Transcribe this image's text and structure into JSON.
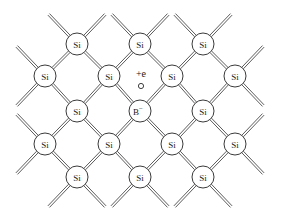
{
  "figure": {
    "background_color": "#ffffff",
    "bond_color": "#4a4a4a",
    "atom_outline_color": "#3a3a3a",
    "label_color": "#1a1a1a",
    "width": 283,
    "height": 222
  },
  "lattice": {
    "atom_radius": 11,
    "bond_gap": 2.2,
    "stub_length": 30,
    "rows": [
      {
        "row_index": 0,
        "y": 44,
        "atoms": [
          {
            "label": "Si",
            "superscript": "",
            "x": 77,
            "y": 44,
            "name": "atom-si-r0c0"
          },
          {
            "label": "Si",
            "superscript": "",
            "x": 140,
            "y": 44,
            "name": "atom-si-r0c1"
          },
          {
            "label": "Si",
            "superscript": "",
            "x": 203,
            "y": 44,
            "name": "atom-si-r0c2"
          }
        ]
      },
      {
        "row_index": 1,
        "y": 76,
        "atoms": [
          {
            "label": "Si",
            "superscript": "",
            "x": 45,
            "y": 76,
            "name": "atom-si-r1c0"
          },
          {
            "label": "Si",
            "superscript": "",
            "x": 109,
            "y": 76,
            "name": "atom-si-r1c1"
          },
          {
            "label": "Si",
            "superscript": "",
            "x": 172,
            "y": 76,
            "name": "atom-si-r1c2"
          },
          {
            "label": "Si",
            "superscript": "",
            "x": 235,
            "y": 76,
            "name": "atom-si-r1c3"
          }
        ]
      },
      {
        "row_index": 2,
        "y": 111,
        "atoms": [
          {
            "label": "Si",
            "superscript": "",
            "x": 77,
            "y": 111,
            "name": "atom-si-r2c0"
          },
          {
            "label": "B",
            "superscript": "−",
            "x": 140,
            "y": 111,
            "name": "atom-boron-dopant"
          },
          {
            "label": "Si",
            "superscript": "",
            "x": 203,
            "y": 111,
            "name": "atom-si-r2c2"
          }
        ]
      },
      {
        "row_index": 3,
        "y": 144,
        "atoms": [
          {
            "label": "Si",
            "superscript": "",
            "x": 45,
            "y": 144,
            "name": "atom-si-r3c0"
          },
          {
            "label": "Si",
            "superscript": "",
            "x": 109,
            "y": 144,
            "name": "atom-si-r3c1"
          },
          {
            "label": "Si",
            "superscript": "",
            "x": 172,
            "y": 144,
            "name": "atom-si-r3c2"
          },
          {
            "label": "Si",
            "superscript": "",
            "x": 235,
            "y": 144,
            "name": "atom-si-r3c3"
          }
        ]
      },
      {
        "row_index": 4,
        "y": 177,
        "atoms": [
          {
            "label": "Si",
            "superscript": "",
            "x": 77,
            "y": 177,
            "name": "atom-si-r4c0"
          },
          {
            "label": "Si",
            "superscript": "",
            "x": 140,
            "y": 177,
            "name": "atom-si-r4c1"
          },
          {
            "label": "Si",
            "superscript": "",
            "x": 203,
            "y": 177,
            "name": "atom-si-r4c2"
          }
        ]
      }
    ]
  },
  "annotations": {
    "charge_label": {
      "text": "+e",
      "x": 141,
      "y": 73,
      "name": "charge-label"
    },
    "hole_marker": {
      "x": 141,
      "y": 86,
      "radius": 2.6,
      "name": "hole-marker"
    }
  }
}
